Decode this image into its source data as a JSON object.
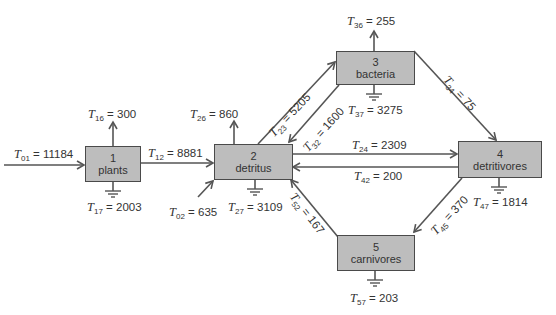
{
  "diagram": {
    "type": "ecosystem energy flow network",
    "colors": {
      "box_fill": "#bdbdbd",
      "box_border": "#4a4a4a",
      "line": "#555555",
      "text": "#333333"
    },
    "compartments": [
      {
        "id": "1",
        "name": "plants"
      },
      {
        "id": "2",
        "name": "detritus"
      },
      {
        "id": "3",
        "name": "bacteria"
      },
      {
        "id": "4",
        "name": "detritivores"
      },
      {
        "id": "5",
        "name": "carnivores"
      }
    ],
    "flows": {
      "T01": {
        "sym": "T",
        "sub": "01",
        "value": "11184"
      },
      "T12": {
        "sym": "T",
        "sub": "12",
        "value": "8881"
      },
      "T16": {
        "sym": "T",
        "sub": "16",
        "value": "300"
      },
      "T17": {
        "sym": "T",
        "sub": "17",
        "value": "2003"
      },
      "T02": {
        "sym": "T",
        "sub": "02",
        "value": "635"
      },
      "T26": {
        "sym": "T",
        "sub": "26",
        "value": "860"
      },
      "T27": {
        "sym": "T",
        "sub": "27",
        "value": "3109"
      },
      "T23": {
        "sym": "T",
        "sub": "23",
        "value": "5205"
      },
      "T32": {
        "sym": "T",
        "sub": "32",
        "value": "1600"
      },
      "T36": {
        "sym": "T",
        "sub": "36",
        "value": "255"
      },
      "T37": {
        "sym": "T",
        "sub": "37",
        "value": "3275"
      },
      "T34": {
        "sym": "T",
        "sub": "34",
        "value": "75"
      },
      "T24": {
        "sym": "T",
        "sub": "24",
        "value": "2309"
      },
      "T42": {
        "sym": "T",
        "sub": "42",
        "value": "200"
      },
      "T47": {
        "sym": "T",
        "sub": "47",
        "value": "1814"
      },
      "T45": {
        "sym": "T",
        "sub": "45",
        "value": "370"
      },
      "T52": {
        "sym": "T",
        "sub": "52",
        "value": "167"
      },
      "T57": {
        "sym": "T",
        "sub": "57",
        "value": "203"
      }
    },
    "eq": "="
  }
}
